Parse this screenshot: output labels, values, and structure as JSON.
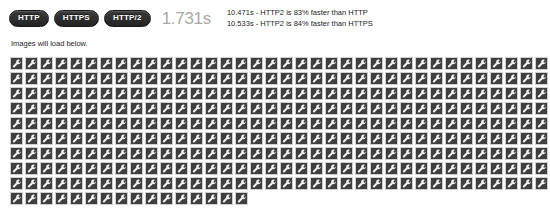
{
  "toolbar": {
    "protocol_buttons": [
      {
        "label": "HTTP",
        "name": "http-button"
      },
      {
        "label": "HTTPS",
        "name": "https-button"
      },
      {
        "label": "HTTP/2",
        "name": "http2-button"
      }
    ],
    "timer_value": "1.731s",
    "stats": [
      "10.471s - HTTP2 is 83% faster than HTTP",
      "10.533s - HTTP2 is 84% faster than HTTPS"
    ]
  },
  "content": {
    "caption": "Images will load below.",
    "grid": {
      "tile_icon": "wrench-icon",
      "columns": 36,
      "rows": 10,
      "last_row_count": 16,
      "total_tiles": 340
    }
  },
  "colors": {
    "button_background": "#2b2b2b",
    "button_text": "#ffffff",
    "timer_text": "#a9a9a9",
    "body_text": "#1d1d1d",
    "tile_background": "#3f3f3f",
    "tile_border": "#cfcfcf",
    "page_background": "#ffffff"
  }
}
